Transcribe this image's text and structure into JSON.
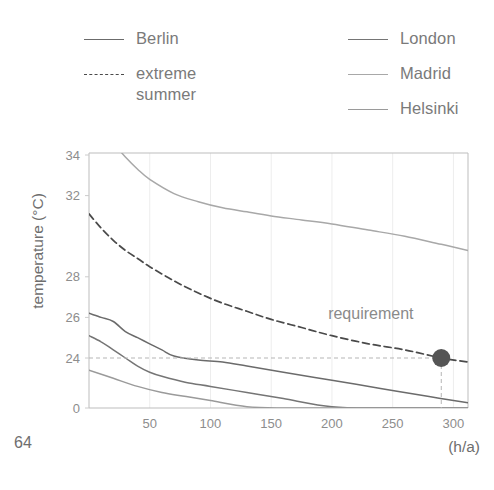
{
  "page": {
    "number": "64"
  },
  "legend": {
    "left_column": [
      {
        "label": "Berlin",
        "style": "solid",
        "color": "#6b6b6b",
        "icon": "line-swatch-icon"
      },
      {
        "label": "extreme\nsummer",
        "style": "dashed",
        "color": "#4a4a4a",
        "icon": "dashed-line-swatch-icon"
      }
    ],
    "right_column": [
      {
        "label": "London",
        "style": "solid",
        "color": "#757575",
        "icon": "line-swatch-icon"
      },
      {
        "label": "Madrid",
        "style": "solid",
        "color": "#a8a8a8",
        "icon": "line-swatch-icon"
      },
      {
        "label": "Helsinki",
        "style": "solid",
        "color": "#9a9a9a",
        "icon": "line-swatch-icon"
      }
    ]
  },
  "chart_data": {
    "type": "line",
    "title": "",
    "xlabel": "(h/a)",
    "ylabel": "temperature (°C)",
    "xlim": [
      0,
      312
    ],
    "ylim_note": "broken y axis: 0 sits directly below 24",
    "x_ticks": [
      50,
      100,
      150,
      200,
      250,
      300
    ],
    "y_ticks": [
      34,
      32,
      28,
      26,
      24,
      0
    ],
    "grid": "faint vertical gridlines at x ticks",
    "legend_position": "above plot, two columns",
    "annotations": [
      {
        "name": "requirement",
        "text": "requirement",
        "x": 232,
        "y": 25.9
      }
    ],
    "markers": [
      {
        "name": "requirement-point",
        "x": 290,
        "y": 24,
        "color": "#555555",
        "radius_px": 9
      }
    ],
    "reference_lines": [
      {
        "name": "requirement-horizontal",
        "orientation": "horizontal",
        "value": 24,
        "style": "dashed"
      },
      {
        "name": "requirement-vertical",
        "orientation": "vertical",
        "value": 290,
        "style": "dashed"
      }
    ],
    "series": [
      {
        "name": "Madrid",
        "color": "#a8a8a8",
        "style": "solid",
        "x": [
          0,
          10,
          20,
          30,
          40,
          50,
          70,
          90,
          110,
          130,
          150,
          175,
          200,
          230,
          260,
          290,
          312
        ],
        "values": [
          36.2,
          35.4,
          34.6,
          33.9,
          33.3,
          32.8,
          32.1,
          31.7,
          31.4,
          31.2,
          31.0,
          30.8,
          30.6,
          30.3,
          30.0,
          29.6,
          29.3
        ]
      },
      {
        "name": "extreme summer",
        "color": "#4a4a4a",
        "style": "dashed",
        "x": [
          0,
          10,
          20,
          30,
          40,
          50,
          70,
          90,
          110,
          130,
          150,
          175,
          200,
          230,
          260,
          290,
          312
        ],
        "values": [
          31.1,
          30.4,
          29.8,
          29.3,
          28.9,
          28.5,
          27.8,
          27.2,
          26.7,
          26.3,
          25.9,
          25.5,
          25.1,
          24.7,
          24.4,
          24.0,
          23.8
        ]
      },
      {
        "name": "Berlin",
        "color": "#6b6b6b",
        "style": "solid",
        "x": [
          0,
          10,
          20,
          30,
          40,
          50,
          60,
          70,
          90,
          110,
          130,
          160,
          200,
          240,
          280,
          312
        ],
        "values": [
          26.2,
          26.0,
          25.8,
          25.3,
          25.0,
          24.7,
          24.4,
          24.1,
          23.9,
          23.8,
          23.6,
          23.3,
          22.9,
          22.5,
          22.1,
          21.8
        ]
      },
      {
        "name": "London",
        "color": "#757575",
        "style": "solid",
        "x": [
          0,
          10,
          20,
          30,
          40,
          50,
          60,
          80,
          100,
          130,
          160,
          200,
          240,
          280,
          312
        ],
        "values": [
          25.1,
          24.8,
          24.4,
          24.0,
          23.6,
          23.3,
          23.1,
          22.8,
          22.6,
          22.3,
          22.0,
          21.6,
          21.2,
          20.8,
          20.5
        ]
      },
      {
        "name": "Helsinki",
        "color": "#9a9a9a",
        "style": "solid",
        "x": [
          0,
          20,
          40,
          60,
          80,
          100,
          130,
          160,
          200,
          240,
          280,
          312
        ],
        "values": [
          23.4,
          23.0,
          22.6,
          22.3,
          22.1,
          21.9,
          21.6,
          21.4,
          21.1,
          20.8,
          20.5,
          20.3
        ]
      }
    ]
  }
}
